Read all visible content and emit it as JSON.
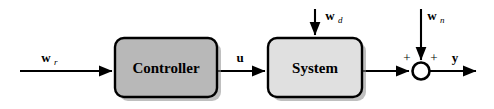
{
  "diagram": {
    "canvas": {
      "width": 494,
      "height": 109,
      "background": "#ffffff"
    },
    "colors": {
      "line": "#000000",
      "controller_fill": "#b8b8b8",
      "system_fill": "#e0e0e0",
      "shadow": "#8a8a8a",
      "text": "#000000",
      "summing_fill": "#ffffff"
    },
    "blocks": [
      {
        "id": "controller",
        "label": "Controller",
        "fill": "#b8b8b8",
        "x": 115,
        "y": 38,
        "width": 102,
        "height": 59,
        "radius": 9
      },
      {
        "id": "system",
        "label": "System",
        "fill": "#e0e0e0",
        "x": 268,
        "y": 38,
        "width": 94,
        "height": 59,
        "radius": 9
      }
    ],
    "summing_junction": {
      "id": "sum",
      "cx": 421,
      "cy": 71,
      "r": 8.5,
      "signs": [
        {
          "label": "+",
          "x": 407,
          "y": 59
        },
        {
          "label": "+",
          "x": 434,
          "y": 59
        }
      ]
    },
    "signals": [
      {
        "id": "wr",
        "base": "w",
        "sub": "r",
        "x": 52,
        "y": 56
      },
      {
        "id": "u",
        "base": "u",
        "sub": "",
        "x": 240,
        "y": 56
      },
      {
        "id": "wd",
        "base": "w",
        "sub": "d",
        "x": 326,
        "y": 16
      },
      {
        "id": "wn",
        "base": "w",
        "sub": "n",
        "x": 428,
        "y": 16
      },
      {
        "id": "y",
        "base": "y",
        "sub": "",
        "x": 455,
        "y": 60
      }
    ],
    "wires": [
      {
        "id": "wire-input-to-controller",
        "from": "w_r source",
        "to": "Controller",
        "path": "M 20 71 L 112 71",
        "arrow": true
      },
      {
        "id": "wire-controller-to-system",
        "from": "Controller",
        "to": "System",
        "path": "M 217 71 L 265 71",
        "arrow": true
      },
      {
        "id": "wire-wd-to-system",
        "from": "w_d source",
        "to": "System",
        "path": "M 315 9 L 315 35",
        "arrow": true
      },
      {
        "id": "wire-system-to-sum",
        "from": "System",
        "to": "Summing junction",
        "path": "M 362 71 L 409 71",
        "arrow": true
      },
      {
        "id": "wire-wn-to-sum",
        "from": "w_n source",
        "to": "Summing junction",
        "path": "M 421 9 L 421 60",
        "arrow": true
      },
      {
        "id": "wire-sum-to-output",
        "from": "Summing junction",
        "to": "y output",
        "path": "M 430 71 L 476 71",
        "arrow": true
      }
    ]
  }
}
